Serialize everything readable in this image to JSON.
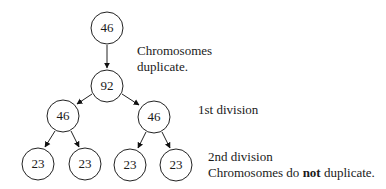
{
  "diagram": {
    "nodes": [
      {
        "id": "n0",
        "label": "46",
        "cx": 107,
        "cy": 28
      },
      {
        "id": "n1",
        "label": "92",
        "cx": 107,
        "cy": 86
      },
      {
        "id": "n2",
        "label": "46",
        "cx": 63,
        "cy": 116
      },
      {
        "id": "n3",
        "label": "46",
        "cx": 154,
        "cy": 117
      },
      {
        "id": "n4",
        "label": "23",
        "cx": 38,
        "cy": 164
      },
      {
        "id": "n5",
        "label": "23",
        "cx": 85,
        "cy": 164
      },
      {
        "id": "n6",
        "label": "23",
        "cx": 130,
        "cy": 165
      },
      {
        "id": "n7",
        "label": "23",
        "cx": 176,
        "cy": 165
      }
    ],
    "edges": [
      [
        "n0",
        "n1"
      ],
      [
        "n1",
        "n2"
      ],
      [
        "n1",
        "n3"
      ],
      [
        "n2",
        "n4"
      ],
      [
        "n2",
        "n5"
      ],
      [
        "n3",
        "n6"
      ],
      [
        "n3",
        "n7"
      ]
    ],
    "annotations": {
      "duplicate_line1": "Chromosomes",
      "duplicate_line2": "duplicate.",
      "first_division": "1st division",
      "second_division": "2nd division",
      "second_note_pre": "Chromosomes do ",
      "second_note_bold": "not",
      "second_note_post": " duplicate."
    }
  }
}
